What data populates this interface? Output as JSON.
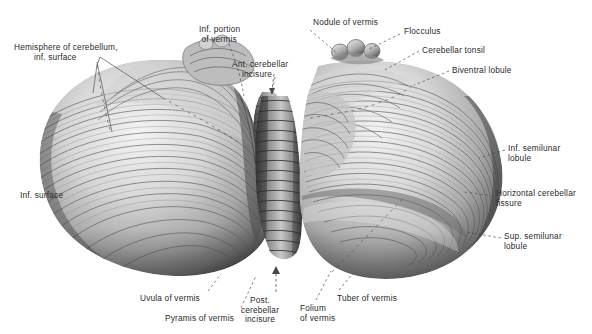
{
  "figure": {
    "kind": "anatomical-photograph",
    "background_color": "#ffffff",
    "label_color": "#2a2a2a",
    "leader_color": "#4a4a4a",
    "specimen_tone_light": "#efefef",
    "specimen_tone_mid": "#9b9b9b",
    "specimen_tone_dark": "#3b3b3b"
  },
  "labels": [
    {
      "id": "hemisphere-inf-surface",
      "text": "Hemisphere of cerebellum,\n        inf. surface",
      "x": 14,
      "y": 43,
      "align": "left"
    },
    {
      "id": "inf-portion-of-vermis",
      "text": "Inf. portion\n of vermis",
      "x": 199,
      "y": 25,
      "align": "left"
    },
    {
      "id": "ant-cerebellar-incisure",
      "text": "Ant. cerebellar\n    incisure",
      "x": 232,
      "y": 60,
      "align": "left"
    },
    {
      "id": "nodule-of-vermis",
      "text": "Nodule of vermis",
      "x": 313,
      "y": 18,
      "align": "left"
    },
    {
      "id": "flocculus",
      "text": "Flocculus",
      "x": 404,
      "y": 27,
      "align": "left"
    },
    {
      "id": "cerebellar-tonsil",
      "text": "Cerebellar tonsil",
      "x": 422,
      "y": 46,
      "align": "left"
    },
    {
      "id": "biventral-lobule",
      "text": "Biventral lobule",
      "x": 452,
      "y": 66,
      "align": "left"
    },
    {
      "id": "inf-semilunar-lobule",
      "text": "Inf. semilunar\nlobule",
      "x": 508,
      "y": 144,
      "align": "left"
    },
    {
      "id": "horizontal-cerebellar-fissure",
      "text": "Horizontal cerebellar\nfissure",
      "x": 496,
      "y": 189,
      "align": "left"
    },
    {
      "id": "sup-semilunar-lobule",
      "text": "Sup. semilunar\nlobule",
      "x": 504,
      "y": 232,
      "align": "left"
    },
    {
      "id": "inf-surface",
      "text": "Inf. surface",
      "x": 20,
      "y": 191,
      "align": "left"
    },
    {
      "id": "uvula-of-vermis",
      "text": "Uvula of vermis",
      "x": 140,
      "y": 294,
      "align": "left"
    },
    {
      "id": "pyramis-of-vermis",
      "text": "Pyramis of vermis",
      "x": 165,
      "y": 314,
      "align": "left"
    },
    {
      "id": "post-cerebellar-incisure",
      "text": "Post.\ncerebellar\nincisure",
      "x": 255,
      "y": 296,
      "align": "center"
    },
    {
      "id": "folium-of-vermis",
      "text": "Folium\nof vermis",
      "x": 300,
      "y": 304,
      "align": "left"
    },
    {
      "id": "tuber-of-vermis",
      "text": "Tuber of vermis",
      "x": 337,
      "y": 294,
      "align": "left"
    }
  ],
  "leaders": [
    {
      "id": "leader-hemisphere-a",
      "points": "100,57 97,65 93,93"
    },
    {
      "id": "leader-hemisphere-b",
      "points": "100,57 163,98"
    },
    {
      "id": "leader-hemisphere-c",
      "points": "97,62 110,130"
    },
    {
      "id": "leader-inf-portion",
      "points": "224,45 238,75 244,100"
    },
    {
      "id": "leader-ant-incisure",
      "points": "275,79 272,95"
    },
    {
      "id": "leader-nodule",
      "points": "310,30 340,55"
    },
    {
      "id": "leader-flocculus",
      "points": "400,35 368,50"
    },
    {
      "id": "leader-tonsil",
      "points": "419,52 384,71"
    },
    {
      "id": "leader-biventral",
      "points": "449,72 413,85"
    },
    {
      "id": "leader-inf-semilunar",
      "points": "505,150 480,158"
    },
    {
      "id": "leader-horizontal-fissure",
      "points": "493,196 465,192"
    },
    {
      "id": "leader-sup-semilunar",
      "points": "501,238 466,232"
    },
    {
      "id": "leader-uvula",
      "points": "208,291 220,275"
    },
    {
      "id": "leader-pyramis",
      "points": "240,308 255,276"
    },
    {
      "id": "leader-post-incisure",
      "points": "276,292 276,268"
    },
    {
      "id": "leader-folium",
      "points": "316,300 330,272"
    },
    {
      "id": "leader-tuber",
      "points": "338,290 352,274"
    }
  ],
  "internal_markings": [
    {
      "id": "fissure-line-left-upper",
      "note": "dashed fissure across left hemisphere"
    },
    {
      "id": "fissure-line-right-upper",
      "note": "dashed fissure across right hemisphere"
    },
    {
      "id": "fissure-line-right-lower",
      "note": "horizontal cerebellar fissure on right"
    }
  ]
}
